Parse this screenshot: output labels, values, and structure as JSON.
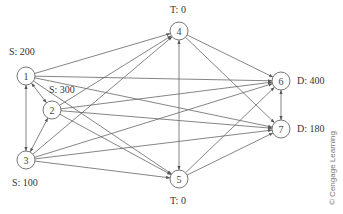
{
  "diagram": {
    "nodes": [
      {
        "id": "1",
        "label": "1",
        "annotation": "S: 200",
        "x": 26,
        "y": 76
      },
      {
        "id": "2",
        "label": "2",
        "annotation": "S: 300",
        "x": 52,
        "y": 110
      },
      {
        "id": "3",
        "label": "3",
        "annotation": "S: 100",
        "x": 26,
        "y": 160
      },
      {
        "id": "4",
        "label": "4",
        "annotation": "T: 0",
        "x": 179,
        "y": 31
      },
      {
        "id": "5",
        "label": "5",
        "annotation": "T: 0",
        "x": 179,
        "y": 179
      },
      {
        "id": "6",
        "label": "6",
        "annotation": "D: 400",
        "x": 281,
        "y": 81
      },
      {
        "id": "7",
        "label": "7",
        "annotation": "D: 180",
        "x": 281,
        "y": 129
      }
    ],
    "edges": [
      {
        "from": "1",
        "to": "2",
        "bidirectional": true
      },
      {
        "from": "1",
        "to": "3",
        "bidirectional": true
      },
      {
        "from": "2",
        "to": "3",
        "bidirectional": true
      },
      {
        "from": "4",
        "to": "5",
        "bidirectional": true
      },
      {
        "from": "6",
        "to": "7",
        "bidirectional": true
      },
      {
        "from": "1",
        "to": "4"
      },
      {
        "from": "1",
        "to": "5"
      },
      {
        "from": "1",
        "to": "6"
      },
      {
        "from": "1",
        "to": "7"
      },
      {
        "from": "2",
        "to": "4"
      },
      {
        "from": "2",
        "to": "5"
      },
      {
        "from": "2",
        "to": "6"
      },
      {
        "from": "2",
        "to": "7"
      },
      {
        "from": "3",
        "to": "4"
      },
      {
        "from": "3",
        "to": "5"
      },
      {
        "from": "3",
        "to": "6"
      },
      {
        "from": "3",
        "to": "7"
      },
      {
        "from": "4",
        "to": "6"
      },
      {
        "from": "4",
        "to": "7"
      },
      {
        "from": "5",
        "to": "6"
      },
      {
        "from": "5",
        "to": "7"
      }
    ],
    "labels": {
      "n1": "S: 200",
      "n2": "S: 300",
      "n3": "S: 100",
      "n4": "T: 0",
      "n5": "T: 0",
      "n6": "D: 400",
      "n7": "D: 180"
    },
    "copyright": "© Cengage Learning"
  }
}
